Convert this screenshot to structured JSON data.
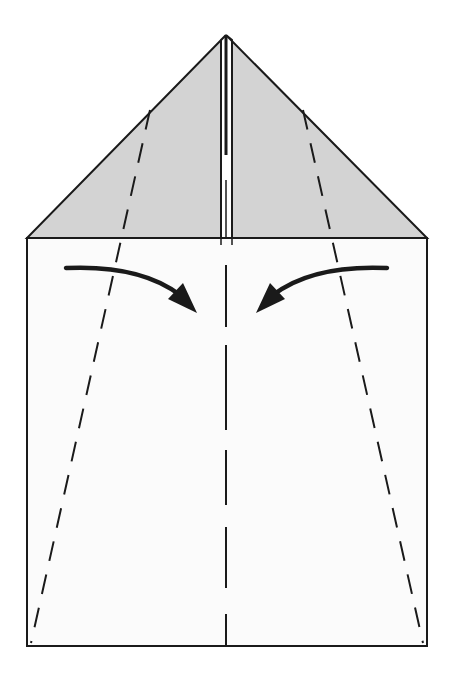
{
  "diagram": {
    "type": "origami-folding-step",
    "colors": {
      "background": "#ffffff",
      "paper_front": "#fbfbfb",
      "paper_flap": "#d3d3d3",
      "line": "#1a1a1a"
    },
    "elements": [
      {
        "name": "folded-triangle-flaps",
        "shape": "triangle",
        "apex": [
          226,
          35
        ],
        "base_left": [
          27,
          238
        ],
        "base_right": [
          427,
          238
        ]
      },
      {
        "name": "paper-body",
        "shape": "rectangle",
        "x": 27,
        "y": 238,
        "width": 400,
        "height": 408
      },
      {
        "name": "centre-crease",
        "style": "dashed",
        "from": [
          226,
          238
        ],
        "to": [
          226,
          646
        ]
      },
      {
        "name": "left-valley-fold",
        "style": "dashed",
        "from": [
          150,
          110
        ],
        "to": [
          31,
          643
        ]
      },
      {
        "name": "right-valley-fold",
        "style": "dashed",
        "from": [
          303,
          110
        ],
        "to": [
          423,
          643
        ]
      },
      {
        "name": "left-fold-arrow",
        "direction": "toward-centre"
      },
      {
        "name": "right-fold-arrow",
        "direction": "toward-centre"
      }
    ]
  }
}
